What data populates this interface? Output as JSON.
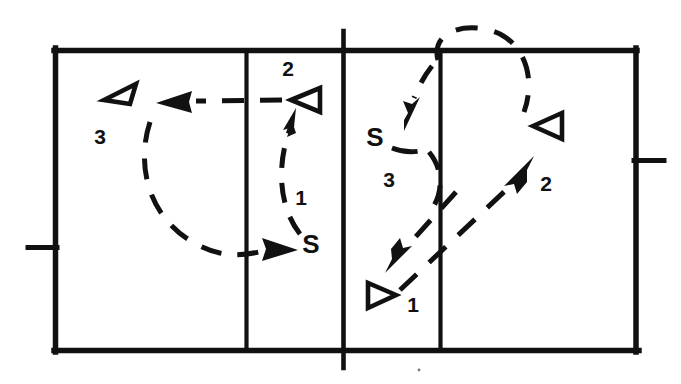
{
  "diagram": {
    "kind": "court-diagram",
    "ink_color": "#111111",
    "background_color": "#ffffff",
    "court": {
      "left": 54,
      "top": 50,
      "right": 637,
      "bottom": 351,
      "center_line_x": 343,
      "left_attack_line_x": 246,
      "right_attack_line_x": 440,
      "hash_left": {
        "y": 248,
        "x_outer": 28,
        "x_inner": 54
      },
      "hash_right": {
        "y": 160,
        "x_inner": 637,
        "x_outer": 663
      }
    },
    "left_half": {
      "name": "left-court",
      "players": [
        {
          "id": "left-player-3",
          "marker": "triangle-up-left",
          "x": 118,
          "y": 92,
          "label": "3",
          "label_x": 100,
          "label_y": 138
        },
        {
          "id": "left-player-2",
          "marker": "triangle-left",
          "x": 306,
          "y": 100,
          "label": "2",
          "label_x": 288,
          "label_y": 70
        },
        {
          "id": "left-setter",
          "marker": "letter-S",
          "x": 311,
          "y": 246,
          "label": "S",
          "seq": "1",
          "seq_x": 301,
          "seq_y": 199
        }
      ],
      "movements": [
        {
          "id": "left-move-1",
          "seq": "1",
          "style": "dashed-curve",
          "from": "setter",
          "to": "player-2"
        },
        {
          "id": "left-move-2",
          "seq": "2",
          "style": "dashed-straight",
          "from": "player-2",
          "to": "player-3"
        },
        {
          "id": "left-move-3",
          "seq": "3",
          "style": "dashed-curve",
          "from": "player-3",
          "to": "setter"
        }
      ]
    },
    "right_half": {
      "name": "right-court",
      "players": [
        {
          "id": "right-setter",
          "marker": "letter-S",
          "x": 375,
          "y": 139,
          "label": "S",
          "seq": "3",
          "seq_x": 389,
          "seq_y": 181
        },
        {
          "id": "right-player-2",
          "marker": "triangle-left",
          "x": 549,
          "y": 126,
          "label": "2",
          "label_x": 546,
          "label_y": 185
        },
        {
          "id": "right-player-1",
          "marker": "triangle-right",
          "x": 381,
          "y": 295,
          "label": "1",
          "label_x": 413,
          "label_y": 306
        }
      ],
      "movements": [
        {
          "id": "right-move-1",
          "seq": "1",
          "style": "dashed-straight",
          "from": "player-2",
          "to": "player-1"
        },
        {
          "id": "right-move-2",
          "seq": "2",
          "style": "dashed-straight",
          "from": "player-1",
          "to": "player-2"
        },
        {
          "id": "right-move-3",
          "seq": "3",
          "style": "dashed-curve",
          "from": "player-2-over-net",
          "to": "setter"
        }
      ]
    }
  }
}
